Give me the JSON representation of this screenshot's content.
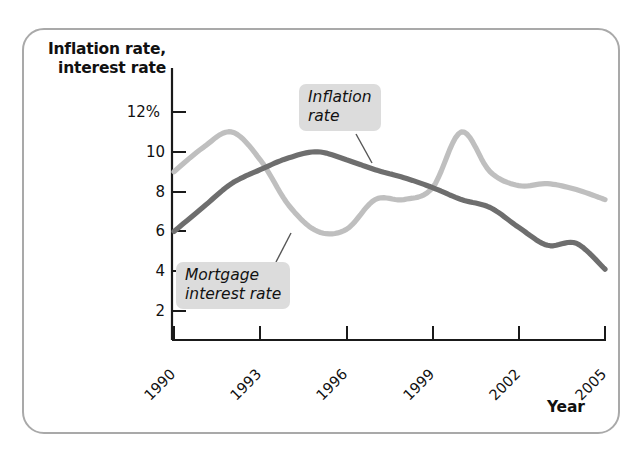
{
  "figure": {
    "y_axis_title_line1": "Inflation rate,",
    "y_axis_title_line2": "interest rate",
    "x_axis_title": "Year",
    "callout_inflation_line1": "Inflation",
    "callout_inflation_line2": "rate",
    "callout_mortgage_line1": "Mortgage",
    "callout_mortgage_line2": "interest rate"
  },
  "colors": {
    "inflation_line": "#6e6e6e",
    "mortgage_line": "#bfbfbf",
    "axis": "#1a1a1a",
    "frame": "#a9a9a9",
    "callout_background": "#dcdcdc"
  },
  "chart_data": {
    "type": "line",
    "title": "",
    "xlabel": "Year",
    "ylabel": "Inflation rate, interest rate",
    "xlim": [
      1990,
      2005
    ],
    "ylim": [
      1.2,
      12.6
    ],
    "grid": false,
    "legend": "annotated-callouts",
    "ytick_labels": [
      "12%",
      "10",
      "8",
      "6",
      "4",
      "2"
    ],
    "ytick_values": [
      12,
      10,
      8,
      6,
      4,
      2
    ],
    "xtick_labels": [
      "1990",
      "1993",
      "1996",
      "1999",
      "2002",
      "2005"
    ],
    "xtick_values": [
      1990,
      1993,
      1996,
      1999,
      2002,
      2005
    ],
    "x": [
      1990,
      1991,
      1992,
      1993,
      1994,
      1995,
      1996,
      1997,
      1998,
      1999,
      2000,
      2001,
      2002,
      2003,
      2004,
      2005
    ],
    "series": [
      {
        "name": "Mortgage interest rate",
        "color": "#bfbfbf",
        "values": [
          9.0,
          10.2,
          11.0,
          9.6,
          7.3,
          6.0,
          6.1,
          7.6,
          7.6,
          8.2,
          11.0,
          9.0,
          8.3,
          8.4,
          8.1,
          7.6
        ]
      },
      {
        "name": "Inflation rate",
        "color": "#6e6e6e",
        "values": [
          6.0,
          7.2,
          8.4,
          9.1,
          9.7,
          10.0,
          9.6,
          9.1,
          8.7,
          8.2,
          7.6,
          7.2,
          6.2,
          5.3,
          5.4,
          4.1
        ]
      }
    ]
  }
}
